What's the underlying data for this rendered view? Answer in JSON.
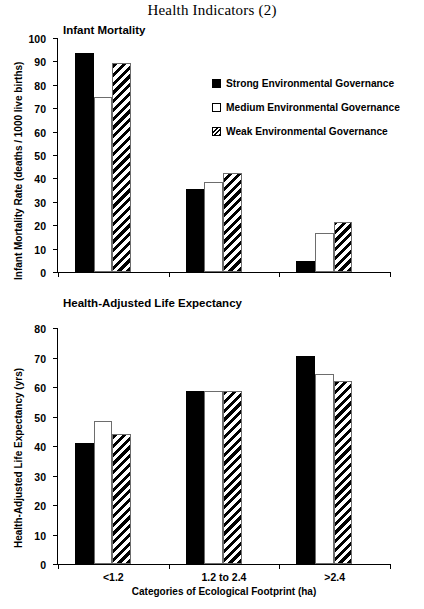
{
  "title": "Health Indicators (2)",
  "legend": {
    "items": [
      {
        "key": "strong",
        "label": "Strong Environmental Governance"
      },
      {
        "key": "medium",
        "label": "Medium Environmental Governance"
      },
      {
        "key": "weak",
        "label": "Weak Environmental Governance"
      }
    ]
  },
  "xlabel": "Categories of Ecological Footprint (ha)",
  "chart_data": [
    {
      "type": "bar",
      "title": "Infant Mortality",
      "xlabel": "Categories of Ecological Footprint (ha)",
      "ylabel": "Infant Mortality Rate (deaths / 1000 live births)",
      "categories": [
        "<1.2",
        "1.2 to 2.4",
        ">2.4"
      ],
      "ylim": [
        0,
        100
      ],
      "yticks": [
        0,
        10,
        20,
        30,
        40,
        50,
        60,
        70,
        80,
        90,
        100
      ],
      "grid": false,
      "legend_position": "right",
      "series": [
        {
          "name": "Strong Environmental Governance",
          "values": [
            93.5,
            35.5,
            4.5
          ]
        },
        {
          "name": "Medium Environmental Governance",
          "values": [
            75.0,
            38.5,
            16.5
          ]
        },
        {
          "name": "Weak Environmental Governance",
          "values": [
            89.5,
            42.5,
            21.5
          ]
        }
      ]
    },
    {
      "type": "bar",
      "title": "Health-Adjusted Life Expectancy",
      "xlabel": "Categories of Ecological Footprint (ha)",
      "ylabel": "Health-Adjusted Life Expectancy (yrs)",
      "categories": [
        "<1.2",
        "1.2 to 2.4",
        ">2.4"
      ],
      "ylim": [
        0,
        80
      ],
      "yticks": [
        0,
        10,
        20,
        30,
        40,
        50,
        60,
        70,
        80
      ],
      "grid": false,
      "legend_position": "none",
      "series": [
        {
          "name": "Strong Environmental Governance",
          "values": [
            41.0,
            58.5,
            70.5
          ]
        },
        {
          "name": "Medium Environmental Governance",
          "values": [
            48.5,
            58.5,
            64.5
          ]
        },
        {
          "name": "Weak Environmental Governance",
          "values": [
            44.0,
            58.5,
            62.0
          ]
        }
      ]
    }
  ],
  "colors": {
    "strong": "#000000",
    "medium": "#ffffff",
    "weak": "#000000",
    "axis": "#000000"
  }
}
